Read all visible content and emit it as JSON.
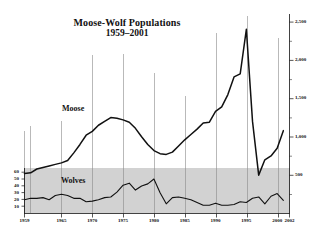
{
  "chart_data": {
    "type": "line",
    "title": "Moose-Wolf Populations",
    "subtitle": "1959–2001",
    "xlabel": "",
    "ylabel": "",
    "grid": true,
    "legend_position": "inline-annotation",
    "x": [
      1959,
      1960,
      1961,
      1962,
      1963,
      1964,
      1965,
      1966,
      1967,
      1968,
      1969,
      1970,
      1971,
      1972,
      1973,
      1974,
      1975,
      1976,
      1977,
      1978,
      1979,
      1980,
      1981,
      1982,
      1983,
      1984,
      1985,
      1986,
      1987,
      1988,
      1989,
      1990,
      1991,
      1992,
      1993,
      1994,
      1995,
      1996,
      1997,
      1998,
      1999,
      2000,
      2001
    ],
    "x_axis": {
      "ticks": [
        1959,
        1965,
        1970,
        1975,
        1980,
        1985,
        1990,
        1995,
        2000,
        2002
      ],
      "tick_labels": [
        "1959",
        "1965",
        "1970",
        "1975",
        "1980",
        "1985",
        "1990",
        "1995",
        "2000",
        "2002"
      ],
      "range": [
        1959,
        2002
      ]
    },
    "y_axis_right": {
      "name": "Moose",
      "ticks": [
        500,
        1000,
        1500,
        2000,
        2500
      ],
      "tick_labels": [
        "500",
        "1,000",
        "1,500",
        "2,000",
        "2,500"
      ],
      "range": [
        0,
        2600
      ]
    },
    "y_axis_left": {
      "name": "Wolves",
      "ticks": [
        10,
        20,
        30,
        40,
        50,
        60
      ],
      "tick_labels": [
        "10",
        "20",
        "30",
        "40",
        "50",
        "60"
      ],
      "range": [
        0,
        66
      ]
    },
    "series": [
      {
        "name": "Moose",
        "axis": "right",
        "annotation": "Moose",
        "values": [
          520,
          530,
          580,
          600,
          620,
          640,
          660,
          690,
          790,
          900,
          1020,
          1070,
          1150,
          1200,
          1250,
          1240,
          1220,
          1190,
          1110,
          1000,
          900,
          820,
          780,
          770,
          800,
          880,
          960,
          1030,
          1100,
          1180,
          1190,
          1330,
          1390,
          1550,
          1780,
          1820,
          2400,
          1200,
          500,
          700,
          750,
          850,
          1080
        ]
      },
      {
        "name": "Wolves",
        "axis": "left",
        "annotation": "Wolves",
        "values": [
          20,
          22,
          22,
          23,
          20,
          26,
          28,
          26,
          22,
          22,
          17,
          18,
          20,
          23,
          24,
          31,
          41,
          44,
          34,
          40,
          43,
          50,
          30,
          14,
          23,
          24,
          22,
          20,
          16,
          12,
          12,
          15,
          12,
          12,
          13,
          17,
          16,
          22,
          24,
          14,
          25,
          29,
          19
        ]
      }
    ]
  }
}
